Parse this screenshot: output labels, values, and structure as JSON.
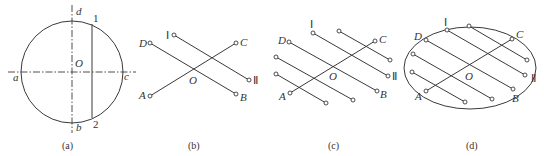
{
  "figure": {
    "panels": [
      {
        "id": "a",
        "caption": "(a)",
        "labels": {
          "d": "d",
          "a": "a",
          "c": "c",
          "b": "b",
          "O": "O",
          "p1": "1",
          "p2": "2"
        }
      },
      {
        "id": "b",
        "caption": "(b)",
        "labels": {
          "D": "D",
          "A": "A",
          "C": "C",
          "B": "B",
          "O": "O",
          "I": "Ⅰ",
          "II": "Ⅱ"
        }
      },
      {
        "id": "c",
        "caption": "(c)",
        "labels": {
          "D": "D",
          "A": "A",
          "C": "C",
          "B": "B",
          "O": "O",
          "I": "Ⅰ",
          "II": "Ⅱ"
        }
      },
      {
        "id": "d",
        "caption": "(d)",
        "labels": {
          "D": "D",
          "A": "A",
          "C": "C",
          "B": "B",
          "O": "O",
          "I": "Ⅰ",
          "II": "Ⅱ"
        }
      }
    ]
  }
}
